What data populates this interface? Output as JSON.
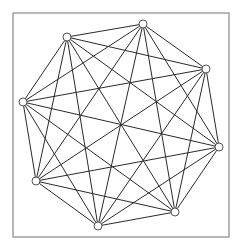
{
  "diagram": {
    "type": "complete-graph",
    "name": "K8",
    "vertex_count": 8,
    "frame": {
      "x": 13,
      "y": 13,
      "width": 216,
      "height": 224,
      "stroke": "#8a8a8a"
    },
    "colors": {
      "edge": "#2a2a2a",
      "node_fill": "#ffffff",
      "node_stroke": "#555555"
    },
    "node_radius": 4,
    "vertices": [
      {
        "id": 0,
        "x": 143,
        "y": 24
      },
      {
        "id": 1,
        "x": 206,
        "y": 69
      },
      {
        "id": 2,
        "x": 219,
        "y": 147
      },
      {
        "id": 3,
        "x": 175,
        "y": 212
      },
      {
        "id": 4,
        "x": 98,
        "y": 226
      },
      {
        "id": 5,
        "x": 36,
        "y": 181
      },
      {
        "id": 6,
        "x": 23,
        "y": 102
      },
      {
        "id": 7,
        "x": 67,
        "y": 37
      }
    ],
    "edges": [
      [
        0,
        1
      ],
      [
        0,
        2
      ],
      [
        0,
        3
      ],
      [
        0,
        4
      ],
      [
        0,
        5
      ],
      [
        0,
        6
      ],
      [
        0,
        7
      ],
      [
        1,
        2
      ],
      [
        1,
        3
      ],
      [
        1,
        4
      ],
      [
        1,
        5
      ],
      [
        1,
        6
      ],
      [
        1,
        7
      ],
      [
        2,
        3
      ],
      [
        2,
        4
      ],
      [
        2,
        5
      ],
      [
        2,
        6
      ],
      [
        2,
        7
      ],
      [
        3,
        4
      ],
      [
        3,
        5
      ],
      [
        3,
        6
      ],
      [
        3,
        7
      ],
      [
        4,
        5
      ],
      [
        4,
        6
      ],
      [
        4,
        7
      ],
      [
        5,
        6
      ],
      [
        5,
        7
      ],
      [
        6,
        7
      ]
    ]
  }
}
